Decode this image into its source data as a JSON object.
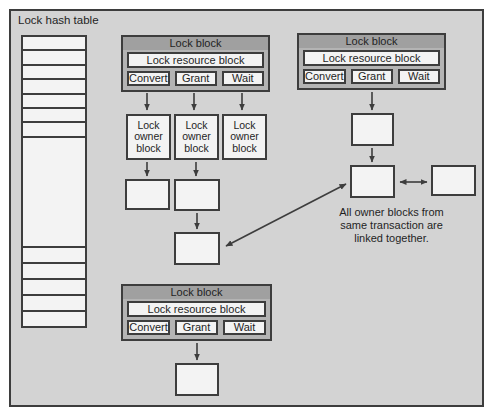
{
  "colors": {
    "page_bg": "#ffffff",
    "diagram_bg": "#d3d3d3",
    "block_bg": "#b4b4b4",
    "block_header_bg": "#a0a0a0",
    "cell_bg": "#f3f3f3",
    "border": "#3d3d3d",
    "text": "#1f1f1f"
  },
  "figure": {
    "hash_table": {
      "label": "Lock hash table",
      "top_rows": 7,
      "bottom_rows": 5
    },
    "lock_block": {
      "title": "Lock block",
      "resource_label": "Lock resource block",
      "queues": {
        "convert": "Convert",
        "grant": "Grant",
        "wait": "Wait"
      }
    },
    "owner_block_label": "Lock owner block",
    "annotation": {
      "line1": "All owner blocks from",
      "line2": "same transaction are",
      "line3": "linked together."
    }
  }
}
